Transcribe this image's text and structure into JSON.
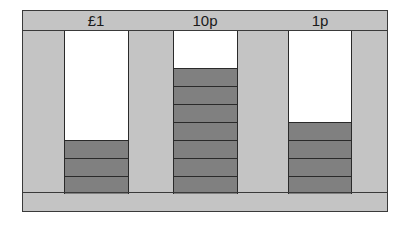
{
  "chart_data": {
    "type": "bar",
    "title": "",
    "categories": [
      "£1",
      "10p",
      "1p"
    ],
    "values": [
      3,
      7,
      4
    ],
    "xlabel": "",
    "ylabel": "",
    "ylim": [
      0,
      9
    ],
    "grid": false,
    "legend": null,
    "style": "stacked unit blocks per coin column"
  },
  "columns": [
    {
      "label": "£1",
      "count": 3
    },
    {
      "label": "10p",
      "count": 7
    },
    {
      "label": "1p",
      "count": 4
    }
  ],
  "colors": {
    "frame": "#c4c4c4",
    "block": "#808080",
    "column_bg": "#ffffff",
    "border": "#2a2a2a"
  }
}
